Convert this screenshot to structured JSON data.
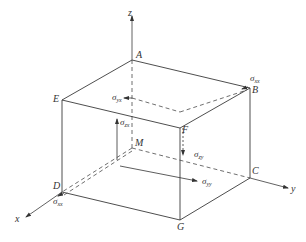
{
  "diagram": {
    "type": "3D stress element (rectangular parallelepiped) with coordinate axes",
    "axes": {
      "x": "x",
      "y": "y",
      "z": "z"
    },
    "vertices": {
      "A": "A",
      "B": "B",
      "C": "C",
      "D": "D",
      "E": "E",
      "F": "F",
      "G": "G",
      "M": "M"
    },
    "stresses": {
      "sxx_B": {
        "sym": "σ",
        "sub": "xx"
      },
      "syx": {
        "sym": "σ",
        "sub": "yx"
      },
      "szx": {
        "sym": "σ",
        "sub": "zx"
      },
      "szy": {
        "sym": "σ",
        "sub": "zy"
      },
      "syy": {
        "sym": "σ",
        "sub": "yy"
      },
      "sxx_D": {
        "sym": "σ",
        "sub": "xx"
      }
    },
    "colors": {
      "line": "#3a3a3a",
      "background": "#ffffff"
    }
  }
}
